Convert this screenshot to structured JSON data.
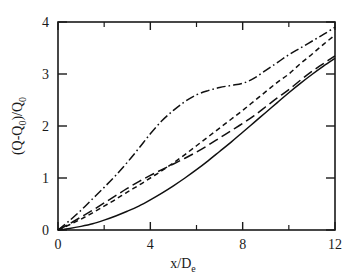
{
  "chart_data": {
    "type": "line",
    "title": "",
    "subtitle": "",
    "xlabel": "x/De",
    "xlabel_main": "x/D",
    "xlabel_sub": "e",
    "ylabel": "(Q-Q0)/Q0",
    "ylabel_parts": {
      "open": "(Q-Q",
      "sub1": "0",
      "mid": ")/Q",
      "sub2": "0"
    },
    "xlim": [
      0,
      12
    ],
    "ylim": [
      0,
      4
    ],
    "grid": false,
    "legend": "none",
    "x_major_ticks": [
      0,
      4,
      8,
      12
    ],
    "x_minor_ticks": [
      2,
      6,
      10
    ],
    "y_major_ticks": [
      0,
      1,
      2,
      3,
      4
    ],
    "x_tick_labels": [
      "0",
      "4",
      "8",
      "12"
    ],
    "y_tick_labels": [
      "0",
      "1",
      "2",
      "3",
      "4"
    ],
    "series": [
      {
        "name": "dash-dot curve",
        "style": "dash-dot",
        "dasharray": "9 3 1.6 3",
        "x": [
          0,
          0.5,
          1,
          1.5,
          2,
          2.5,
          3,
          3.5,
          4,
          4.5,
          5,
          5.5,
          6,
          6.5,
          7,
          7.5,
          8,
          8.5,
          9,
          9.5,
          10,
          10.5,
          11,
          11.5,
          12
        ],
        "y": [
          0,
          0.18,
          0.38,
          0.6,
          0.82,
          1.05,
          1.3,
          1.57,
          1.85,
          2.1,
          2.3,
          2.47,
          2.6,
          2.68,
          2.74,
          2.78,
          2.82,
          2.92,
          3.07,
          3.22,
          3.37,
          3.5,
          3.63,
          3.76,
          3.9
        ]
      },
      {
        "name": "short-dash curve",
        "style": "short-dash",
        "dasharray": "5 3.5",
        "x": [
          0,
          0.5,
          1,
          1.5,
          2,
          2.5,
          3,
          3.5,
          4,
          4.5,
          5,
          5.5,
          6,
          6.5,
          7,
          7.5,
          8,
          8.5,
          9,
          9.5,
          10,
          10.5,
          11,
          11.5,
          12
        ],
        "y": [
          0,
          0.1,
          0.21,
          0.33,
          0.46,
          0.59,
          0.73,
          0.86,
          1.0,
          1.14,
          1.29,
          1.45,
          1.62,
          1.79,
          1.96,
          2.13,
          2.3,
          2.48,
          2.66,
          2.84,
          3.0,
          3.2,
          3.38,
          3.57,
          3.75
        ]
      },
      {
        "name": "long-dash curve",
        "style": "long-dash",
        "dasharray": "10 4.5",
        "x": [
          0,
          0.5,
          1,
          1.5,
          2,
          2.5,
          3,
          3.5,
          4,
          4.5,
          5,
          5.5,
          6,
          6.5,
          7,
          7.5,
          8,
          8.5,
          9,
          9.5,
          10,
          10.5,
          11,
          11.5,
          12
        ],
        "y": [
          0,
          0.12,
          0.25,
          0.38,
          0.52,
          0.66,
          0.8,
          0.93,
          1.05,
          1.16,
          1.27,
          1.38,
          1.5,
          1.63,
          1.77,
          1.91,
          2.05,
          2.2,
          2.37,
          2.54,
          2.7,
          2.88,
          3.05,
          3.2,
          3.35
        ]
      },
      {
        "name": "solid curve",
        "style": "solid",
        "dasharray": "none",
        "x": [
          0,
          0.5,
          1,
          1.5,
          2,
          2.5,
          3,
          3.5,
          4,
          4.5,
          5,
          5.5,
          6,
          6.5,
          7,
          7.5,
          8,
          8.5,
          9,
          9.5,
          10,
          10.5,
          11,
          11.5,
          12
        ],
        "y": [
          0,
          0.03,
          0.07,
          0.12,
          0.19,
          0.27,
          0.36,
          0.46,
          0.58,
          0.71,
          0.85,
          1.0,
          1.16,
          1.33,
          1.51,
          1.69,
          1.88,
          2.07,
          2.26,
          2.45,
          2.64,
          2.82,
          2.99,
          3.15,
          3.3
        ]
      }
    ]
  }
}
